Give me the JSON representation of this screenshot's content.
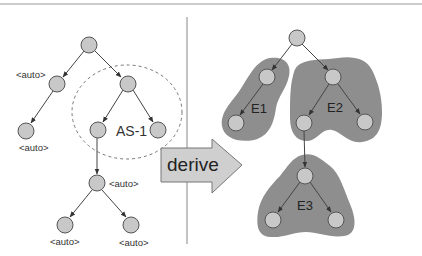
{
  "figure": {
    "header_cut_text": "g",
    "colors": {
      "node_fill": "#c8c8c8",
      "node_stroke": "#555555",
      "region_fill": "#8e8e8e",
      "arrow_fill": "#cfcfcf",
      "separator": "#888888"
    }
  },
  "left_panel": {
    "labels": {
      "root_left_child": "<auto>",
      "left_leaf": "<auto>",
      "mid_node": "<auto>",
      "bottom_left_leaf": "<auto>",
      "bottom_right_leaf": "<auto>"
    },
    "group": {
      "label": "AS-1",
      "style": "dashed-circle"
    }
  },
  "arrow": {
    "label": "derive"
  },
  "right_panel": {
    "regions": [
      {
        "id": "E1",
        "label": "E1"
      },
      {
        "id": "E2",
        "label": "E2"
      },
      {
        "id": "E3",
        "label": "E3"
      }
    ]
  }
}
